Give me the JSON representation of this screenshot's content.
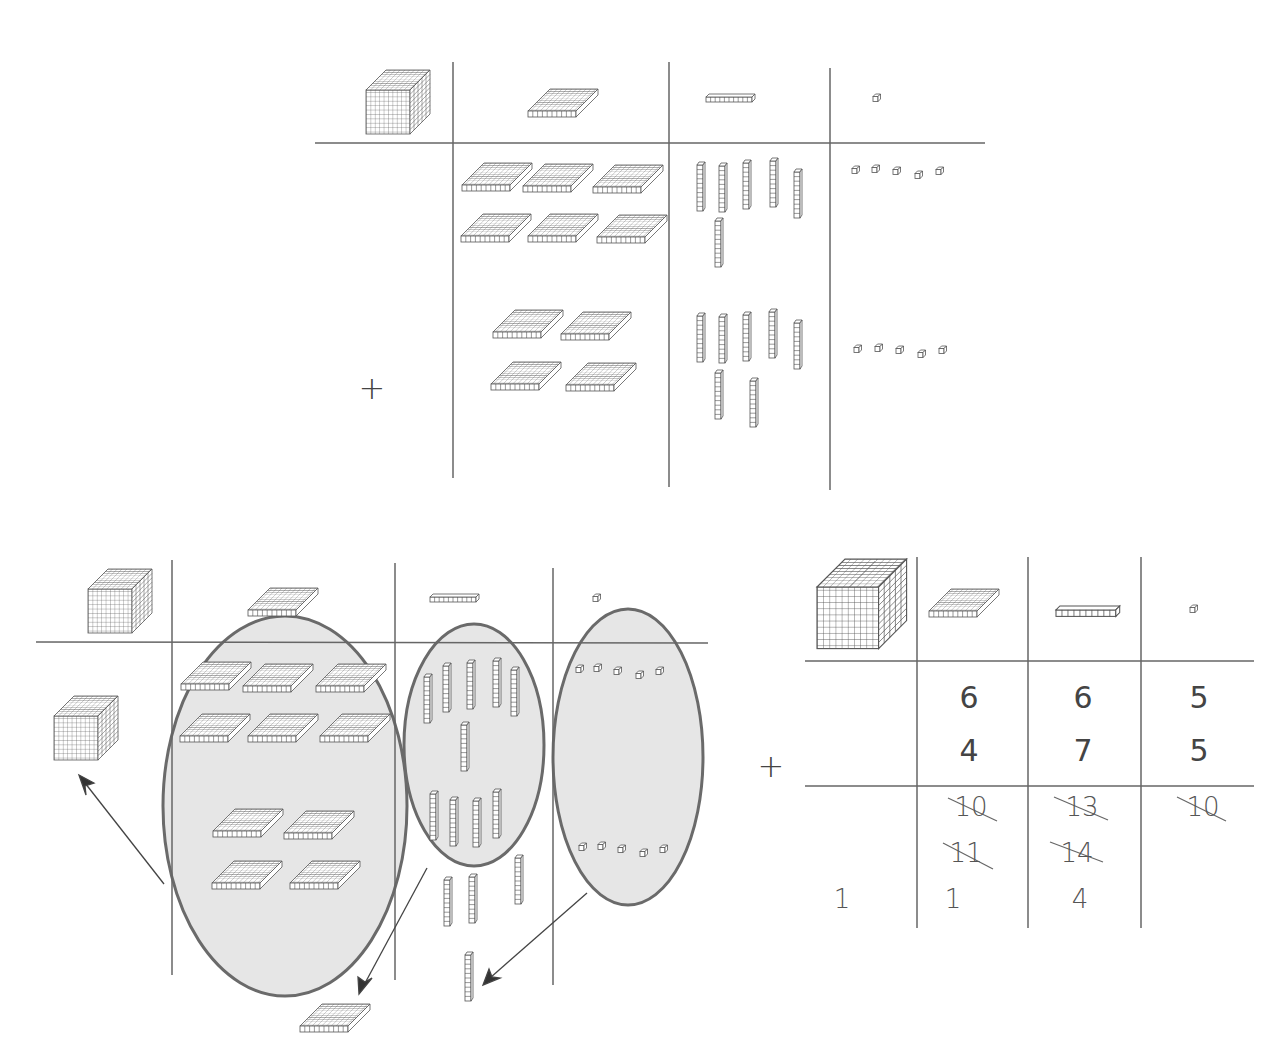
{
  "diagram": {
    "columns": [
      "thousands",
      "hundreds",
      "tens",
      "ones"
    ],
    "column_icons": [
      "thousand-cube-icon",
      "hundred-flat-icon",
      "ten-rod-icon",
      "unit-cube-icon"
    ],
    "colors": {
      "line": "#666666",
      "oval_fill": "#e6e6e6",
      "oval_stroke": "#6a6a6a",
      "block_stroke": "#555555"
    }
  },
  "panel_top": {
    "plus_sign": "+",
    "addend1": {
      "hundreds": 6,
      "tens": 6,
      "ones": 5
    },
    "addend2": {
      "hundreds": 4,
      "tens": 7,
      "ones": 5
    }
  },
  "panel_regroup": {
    "groups": [
      {
        "column": "hundreds",
        "count": 10,
        "becomes": "1 thousand"
      },
      {
        "column": "tens",
        "count": 10,
        "becomes": "1 hundred"
      },
      {
        "column": "ones",
        "count": 10,
        "becomes": "1 ten"
      }
    ],
    "leftover": {
      "tens_rods": 4,
      "extra_hundred_flats": 1,
      "extra_ten_rods": 1,
      "thousand_cubes": 1
    }
  },
  "panel_table": {
    "plus_sign": "+",
    "row1": {
      "hundreds": "6",
      "tens": "6",
      "ones": "5"
    },
    "row2": {
      "hundreds": "4",
      "tens": "7",
      "ones": "5"
    },
    "work": {
      "hundreds_1": "10",
      "tens_1": "13",
      "ones_1": "10",
      "hundreds_2": "11",
      "tens_2": "14"
    },
    "answer": {
      "thousands": "1",
      "hundreds": "1",
      "tens": "4"
    }
  }
}
